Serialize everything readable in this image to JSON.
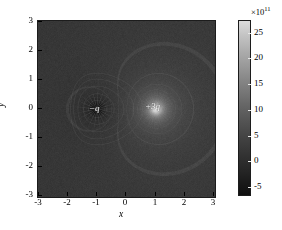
{
  "figure": {
    "background_color": "#ffffff",
    "axes_color": "#000000",
    "plot_background": "#141414"
  },
  "axes": {
    "x": {
      "label": "x",
      "ticks": [
        "-3",
        "-2",
        "-1",
        "0",
        "1",
        "2",
        "3"
      ],
      "tick_values": [
        -3,
        -2,
        -1,
        0,
        1,
        2,
        3
      ],
      "range": [
        -3,
        3
      ]
    },
    "y": {
      "label": "y",
      "ticks": [
        "3",
        "2",
        "1",
        "0",
        "-1",
        "-2",
        "-3"
      ],
      "tick_values": [
        3,
        2,
        1,
        0,
        -1,
        -2,
        -3
      ],
      "range": [
        -3,
        3
      ]
    }
  },
  "annotations": [
    {
      "name": "negative-charge-label",
      "text": "−q",
      "x": -1.0,
      "y": -0.25
    },
    {
      "name": "positive-charge-label",
      "text": "+3q",
      "x": 0.9,
      "y": -0.2
    }
  ],
  "colorbar": {
    "exponent_prefix": "×10",
    "exponent_power": "11",
    "exponent_label": "×10¹¹",
    "ticks": [
      "25",
      "20",
      "15",
      "10",
      "5",
      "0",
      "-5"
    ],
    "tick_values": [
      25,
      20,
      15,
      10,
      5,
      0,
      -5
    ],
    "range": [
      -7,
      27
    ],
    "colormap": "gray",
    "orientation": "vertical",
    "position": "right"
  },
  "chart_data": {
    "type": "heatmap",
    "title": "",
    "subtitle": "",
    "xlabel": "x",
    "ylabel": "y",
    "xlim": [
      -3,
      3
    ],
    "ylim": [
      -3,
      3
    ],
    "xticks": [
      -3,
      -2,
      -1,
      0,
      1,
      2,
      3
    ],
    "yticks": [
      -3,
      -2,
      -1,
      0,
      1,
      2,
      3
    ],
    "grid": false,
    "legend": null,
    "colormap": "gray",
    "colorbar_label": "×10¹¹",
    "colorbar_ticks": [
      -5,
      0,
      5,
      10,
      15,
      20,
      25
    ],
    "clim": [
      -7,
      27
    ],
    "scale_factor": 100000000000.0,
    "point_charges": [
      {
        "label": "−q",
        "x": -1.0,
        "y": 0.0,
        "sign": -1,
        "magnitude": 1
      },
      {
        "label": "+3q",
        "x": 1.0,
        "y": 0.0,
        "sign": 1,
        "magnitude": 3
      }
    ],
    "annotations": [
      {
        "text": "−q",
        "x": -1.0,
        "y": -0.25
      },
      {
        "text": "+3q",
        "x": 0.9,
        "y": -0.2
      }
    ]
  }
}
